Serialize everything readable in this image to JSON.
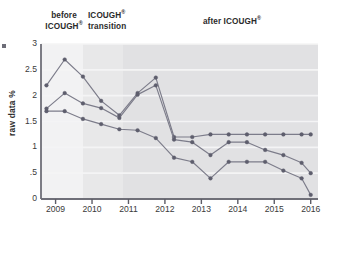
{
  "figure": {
    "y_axis_title": "raw data %",
    "phases": [
      {
        "id": "before",
        "line1": "before",
        "line2": "ICOUGH",
        "sup": "®"
      },
      {
        "id": "transition",
        "line1": "ICOUGH",
        "sup": "®",
        "line2": "transition"
      },
      {
        "id": "after",
        "line1": "after ICOUGH",
        "sup": "®",
        "line2": ""
      }
    ]
  },
  "chart_data": {
    "type": "line",
    "title": "",
    "xlabel": "",
    "ylabel": "raw data %",
    "xlim": [
      2008.6,
      2016.2
    ],
    "ylim": [
      0,
      3
    ],
    "yticks": [
      0,
      0.5,
      1,
      1.5,
      2,
      2.5,
      3
    ],
    "ytick_labels": [
      "0",
      ".5",
      "1",
      "1.5",
      "2",
      "2.5",
      "3"
    ],
    "xticks": [
      2009,
      2010,
      2011,
      2012,
      2013,
      2014,
      2015,
      2016
    ],
    "xtick_labels": [
      "2009",
      "2010",
      "2011",
      "2012",
      "2013",
      "2014",
      "2015",
      "2016"
    ],
    "grid": true,
    "legend": "none",
    "marker": "circle",
    "line_color": "#7c7c8a",
    "marker_color": "#5e5e6d",
    "x": [
      2008.75,
      2009.25,
      2009.75,
      2010.25,
      2010.75,
      2011.25,
      2011.75,
      2012.25,
      2012.75,
      2013.25,
      2013.75,
      2014.25,
      2014.75,
      2015.25,
      2015.75,
      2016.0
    ],
    "series": [
      {
        "name": "series-1",
        "values": [
          2.2,
          2.7,
          2.37,
          1.9,
          1.62,
          2.05,
          2.35,
          1.2,
          1.2,
          1.25,
          1.25,
          1.25,
          1.25,
          1.25,
          1.25,
          1.25
        ]
      },
      {
        "name": "series-2",
        "values": [
          1.75,
          2.05,
          1.85,
          1.76,
          1.57,
          2.02,
          2.2,
          1.15,
          1.1,
          0.85,
          1.1,
          1.1,
          0.95,
          0.85,
          0.7,
          0.5
        ]
      },
      {
        "name": "series-3",
        "values": [
          1.7,
          1.7,
          1.55,
          1.45,
          1.35,
          1.33,
          1.18,
          0.8,
          0.72,
          0.4,
          0.72,
          0.72,
          0.72,
          0.55,
          0.4,
          0.08
        ]
      }
    ],
    "bands": [
      {
        "name": "before-icough",
        "x_start": 2008.6,
        "x_end": 2009.75,
        "color": "#f2f2f3"
      },
      {
        "name": "icough-transition",
        "x_start": 2009.75,
        "x_end": 2010.85,
        "color": "#e8e8e9"
      },
      {
        "name": "after-icough",
        "x_start": 2010.85,
        "x_end": 2016.2,
        "color": "#e1e1e3"
      }
    ]
  }
}
